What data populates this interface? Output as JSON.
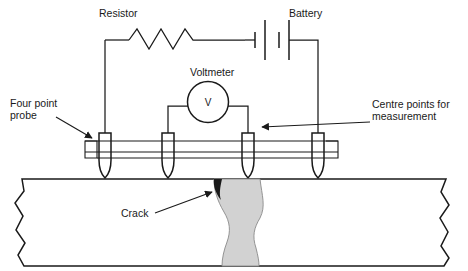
{
  "figure": {
    "title_text": "",
    "colors": {
      "line": "#1a1a1a",
      "crack_fill": "#d2d2d2",
      "background": "#ffffff"
    }
  },
  "labels": {
    "resistor": "Resistor",
    "battery": "Battery",
    "voltmeter": "Voltmeter",
    "voltmeter_symbol": "V",
    "four_point_probe_line1": "Four point",
    "four_point_probe_line2": "probe",
    "centre_points_line1": "Centre points for",
    "centre_points_line2": "measurement",
    "crack": "Crack"
  },
  "components": {
    "probe_count": 4,
    "probe_positions_x": [
      105,
      168,
      248,
      318
    ],
    "resistor_peaks": 3,
    "battery_plates": 4
  }
}
